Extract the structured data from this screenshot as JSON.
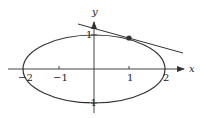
{
  "figure": {
    "type": "ellipse-with-tangent",
    "equation_note": "x^2/4 + y^2 = 1",
    "axes": {
      "x_label": "x",
      "y_label": "y",
      "x_ticks": [
        {
          "value": -2,
          "label": "−2"
        },
        {
          "value": -1,
          "label": "−1"
        },
        {
          "value": 1,
          "label": "1"
        },
        {
          "value": 2,
          "label": "2"
        }
      ],
      "y_ticks": [
        {
          "value": 1,
          "label": "1"
        },
        {
          "value": -1,
          "label": "−1"
        }
      ]
    },
    "ellipse": {
      "a": 2,
      "b": 1,
      "center": [
        0,
        0
      ]
    },
    "point": {
      "x": 1,
      "y": 0.866
    },
    "tangent_line": {
      "from": [
        -0.23,
        1.27
      ],
      "to": [
        1.25,
        0.46
      ]
    },
    "colors": {
      "stroke": "#333333",
      "background": "#ffffff"
    }
  }
}
